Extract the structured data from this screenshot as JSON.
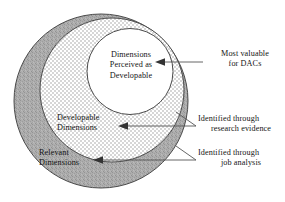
{
  "figure": {
    "background": "#ffffff"
  },
  "colors": {
    "outer_ring_fill": "#ababab",
    "outer_ring_speckle": "#8e8e8e",
    "middle_ring_checker": "#d6d6d6",
    "middle_ring_base": "#ffffff",
    "inner_fill": "#ffffff",
    "stroke": "#4a4a4a",
    "text": "#151515",
    "leader_line": "#555555"
  },
  "regions": [
    {
      "id": "outer",
      "name": "Relevant Dimensions",
      "label_line1": "Relevant",
      "label_line2": "Dimensions",
      "fill": "speckled-gray"
    },
    {
      "id": "middle",
      "name": "Developable Dimensions",
      "label_line1": "Developable",
      "label_line2": "Dimensions",
      "fill": "checkered"
    },
    {
      "id": "inner",
      "name": "Dimensions Perceived as Developable",
      "label_line1": "Dimensions",
      "label_line2": "Perceived as",
      "label_line3": "Developable",
      "fill": "white"
    }
  ],
  "annotations": [
    {
      "id": "top",
      "line1": "Most valuable",
      "line2": "for DACs",
      "target": "inner",
      "arrow_direction": "left"
    },
    {
      "id": "middle",
      "line1": "Identified through",
      "line2": "research evidence",
      "target": "middle",
      "arrow_direction": "left"
    },
    {
      "id": "bottom",
      "line1": "Identified through",
      "line2": "job analysis",
      "target": "outer",
      "arrow_direction": "left"
    }
  ]
}
